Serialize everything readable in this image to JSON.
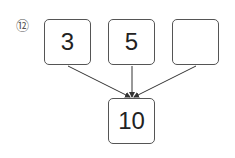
{
  "problem_number": "⑫",
  "top_boxes": [
    {
      "value": "3"
    },
    {
      "value": "5"
    },
    {
      "value": ""
    }
  ],
  "result_box": {
    "value": "10"
  }
}
